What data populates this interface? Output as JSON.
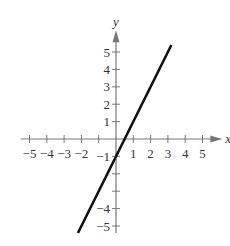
{
  "chart_data": {
    "type": "line",
    "title": "",
    "xlabel": "x",
    "ylabel": "y",
    "xlim": [
      -5.5,
      5.8
    ],
    "ylim": [
      -5.4,
      5.9
    ],
    "grid": false,
    "x_ticks": [
      -5,
      -4,
      -3,
      -2,
      -1,
      1,
      2,
      3,
      4,
      5
    ],
    "x_tick_labels": [
      "−5",
      "−4",
      "−3",
      "−2",
      "",
      "1",
      "2",
      "3",
      "4",
      "5"
    ],
    "y_ticks": [
      -5,
      -4,
      -3,
      -2,
      -1,
      1,
      2,
      3,
      4,
      5
    ],
    "y_tick_labels": [
      "−5",
      "−4",
      "",
      "",
      "−1",
      "1",
      "2",
      "3",
      "4",
      "5"
    ],
    "series": [
      {
        "name": "y = 2x − 1",
        "equation": "y = 2x - 1",
        "slope": 2,
        "intercept": -1,
        "x": [
          -2.2,
          3.2
        ],
        "y": [
          -5.4,
          5.4
        ],
        "color": "#111111"
      }
    ]
  },
  "colors": {
    "axis": "#777777",
    "line": "#111111",
    "text": "#333333"
  }
}
